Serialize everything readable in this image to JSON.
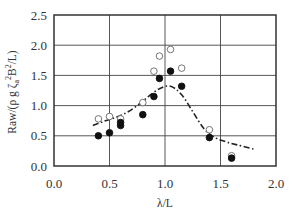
{
  "chart_data": {
    "type": "scatter",
    "title": "",
    "xlabel": "λ/L",
    "ylabel": "Raw/(ρ g ζa² B²/L)",
    "ylabel_parts": {
      "pre": "Raw/(ρ g ζ",
      "sub": "a",
      "mid": " ",
      "sup": "2",
      "post": "B",
      "sup2": "2",
      "end": "/L)"
    },
    "xlim": [
      0.0,
      2.0
    ],
    "ylim": [
      0.0,
      2.5
    ],
    "xticks": [
      "0.0",
      "0.5",
      "1.0",
      "1.5",
      "2.0"
    ],
    "yticks": [
      "0.0",
      "0.5",
      "1.0",
      "1.5",
      "2.0",
      "2.5"
    ],
    "grid": true,
    "legend": null,
    "series": [
      {
        "name": "open circles",
        "marker": "open-circle",
        "x": [
          0.4,
          0.5,
          0.6,
          0.8,
          0.9,
          0.95,
          1.05,
          1.15,
          1.4,
          1.6
        ],
        "y": [
          0.78,
          0.82,
          0.78,
          1.05,
          1.57,
          1.82,
          1.93,
          1.62,
          0.6,
          0.17
        ]
      },
      {
        "name": "filled circles",
        "marker": "filled-circle",
        "x": [
          0.4,
          0.5,
          0.6,
          0.6,
          0.8,
          0.9,
          0.95,
          1.05,
          1.15,
          1.4,
          1.6
        ],
        "y": [
          0.5,
          0.55,
          0.67,
          0.72,
          0.85,
          1.15,
          1.45,
          1.57,
          1.32,
          0.47,
          0.13
        ]
      },
      {
        "name": "dash-dot curve",
        "marker": "line-dashdot",
        "x": [
          0.35,
          0.45,
          0.55,
          0.65,
          0.75,
          0.85,
          0.95,
          1.05,
          1.15,
          1.25,
          1.35,
          1.45,
          1.55,
          1.65,
          1.8
        ],
        "y": [
          0.67,
          0.74,
          0.8,
          0.88,
          1.0,
          1.15,
          1.28,
          1.32,
          1.18,
          0.9,
          0.62,
          0.47,
          0.4,
          0.35,
          0.28
        ]
      }
    ]
  }
}
